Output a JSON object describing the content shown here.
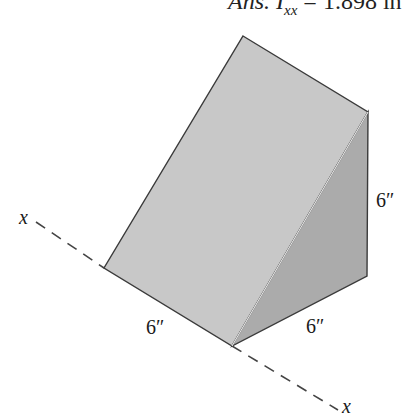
{
  "answer": {
    "prefix": "Ans. I",
    "subscript": "xx",
    "equals": " = ",
    "value": "1.898 in"
  },
  "figure": {
    "colors": {
      "sloped_face": "#c6c6c6",
      "side_face": "#a9a9a9",
      "edge": "#3a3a3a",
      "axis": "#444444"
    },
    "labels": {
      "bottom_left_dim": "6″",
      "bottom_right_dim": "6″",
      "height_dim": "6″",
      "axis_start": "x",
      "axis_end": "x"
    }
  }
}
